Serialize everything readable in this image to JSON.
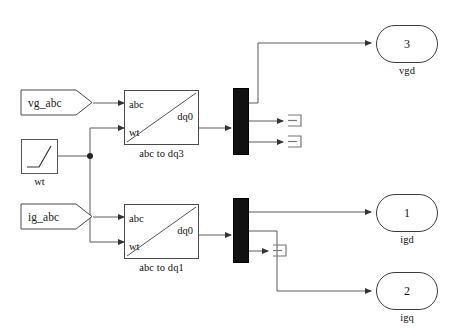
{
  "diagram": {
    "background_color": "#ffffff",
    "line_color": "#4a4a4a",
    "demux_color": "#111111"
  },
  "inports": [
    {
      "name": "vg_abc",
      "label": "vg_abc"
    },
    {
      "name": "ig_abc",
      "label": "ig_abc"
    }
  ],
  "source_blocks": [
    {
      "name": "ramp-wt",
      "caption": "wt",
      "icon": "ramp-icon"
    }
  ],
  "transform_blocks": [
    {
      "name": "abc-to-dq3",
      "caption": "abc to dq3",
      "input_ports": [
        "abc",
        "wt"
      ],
      "output_ports": [
        "dq0"
      ]
    },
    {
      "name": "abc-to-dq1",
      "caption": "abc to dq1",
      "input_ports": [
        "abc",
        "wt"
      ],
      "output_ports": [
        "dq0"
      ]
    }
  ],
  "demux_blocks": [
    {
      "name": "demux-vg",
      "outputs": 3
    },
    {
      "name": "demux-ig",
      "outputs": 3
    }
  ],
  "terminators": [
    {
      "name": "terminator-vg-q"
    },
    {
      "name": "terminator-vg-0"
    },
    {
      "name": "terminator-ig-0"
    }
  ],
  "outports": [
    {
      "name": "vgd",
      "number": "3",
      "caption": "vgd"
    },
    {
      "name": "igd",
      "number": "1",
      "caption": "igd"
    },
    {
      "name": "igq",
      "number": "2",
      "caption": "igq"
    }
  ]
}
